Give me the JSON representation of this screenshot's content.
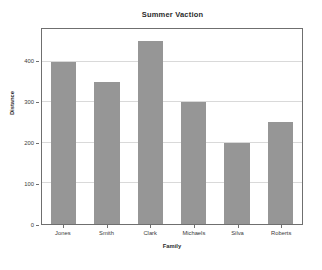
{
  "chart_data": {
    "type": "bar",
    "title": "Summer Vaction",
    "xlabel": "Family",
    "ylabel": "Distance",
    "categories": [
      "Jones",
      "Smith",
      "Clark",
      "Michaels",
      "Silva",
      "Roberts"
    ],
    "values": [
      400,
      350,
      450,
      300,
      200,
      250
    ],
    "yticks": [
      0,
      100,
      200,
      300,
      400
    ],
    "ytick_labels": [
      "0",
      "100",
      "200",
      "300",
      "400"
    ],
    "ylim": [
      0,
      480
    ],
    "grid": true,
    "legend": null,
    "bar_color": "#969696",
    "frame_color": "#6f6f6f",
    "grid_color": "#d9d9d9",
    "background_color": "#ffffff",
    "text_color": "#3a3a3a"
  }
}
